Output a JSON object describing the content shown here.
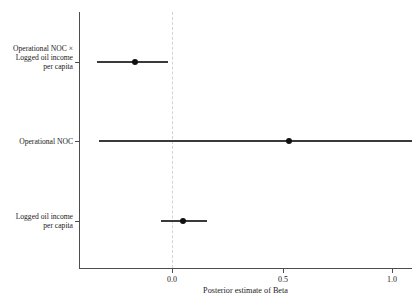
{
  "figure": {
    "clipped_title": "",
    "xlabel": "Posterior estimate of Beta",
    "ylabel": "",
    "zero_reference": "0.0"
  },
  "axis": {
    "x_ticks": [
      "0.0",
      "0.5",
      "1.0"
    ],
    "x_tick_values": [
      0.0,
      0.5,
      1.0
    ],
    "x_min": -0.45,
    "x_max": 1.09
  },
  "rows": [
    {
      "label": "Operational NOC ×\nLogged oil income\nper capita",
      "label_plain": "Operational NOC x Logged oil income per capita"
    },
    {
      "label": "Operational NOC",
      "label_plain": "Operational NOC"
    },
    {
      "label": "Logged oil income\nper capita",
      "label_plain": "Logged oil income per capita"
    }
  ],
  "chart_data": {
    "type": "scatter",
    "subtype": "forest-plot",
    "title": "",
    "xlabel": "Posterior estimate of Beta",
    "ylabel": "",
    "xlim": [
      -0.45,
      1.09
    ],
    "xticks": [
      0.0,
      0.5,
      1.0
    ],
    "xticklabels": [
      "0.0",
      "0.5",
      "1.0"
    ],
    "grid": false,
    "legend": "none",
    "reference_line": {
      "x": 0.0,
      "style": "dashed",
      "color": "#d3d3d3"
    },
    "categories": [
      "Operational NOC × Logged oil income per capita",
      "Operational NOC",
      "Logged oil income per capita"
    ],
    "point_color": "#111111",
    "interval_color": "#3a3a3a",
    "points": [
      {
        "category": "Operational NOC × Logged oil income per capita",
        "estimate": -0.17,
        "ci_low": -0.34,
        "ci_high": -0.02,
        "ci_clipped_right": false
      },
      {
        "category": "Operational NOC",
        "estimate": 0.53,
        "ci_low": -0.33,
        "ci_high": 1.09,
        "ci_clipped_right": true
      },
      {
        "category": "Logged oil income per capita",
        "estimate": 0.05,
        "ci_low": -0.05,
        "ci_high": 0.16,
        "ci_clipped_right": false
      }
    ]
  },
  "colors": {
    "background": "#ffffff",
    "axis": "#4d4d4d",
    "point": "#111111",
    "interval": "#3a3a3a",
    "reference": "#d3d3d3"
  }
}
